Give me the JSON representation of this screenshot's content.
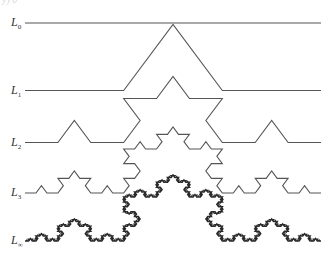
{
  "figure": {
    "title_fragment": "y) 0",
    "stroke_color": "#555555",
    "limit_stroke_color": "#2a2a2a",
    "x_start": 25,
    "x_end": 321,
    "peak_height": 66,
    "curves": [
      {
        "id": "L0",
        "label": "L",
        "subscript": "0",
        "iterations": 0,
        "baseline_y": 23,
        "stroke_width": 1.1
      },
      {
        "id": "L1",
        "label": "L",
        "subscript": "1",
        "iterations": 1,
        "baseline_y": 90.5,
        "stroke_width": 1.1
      },
      {
        "id": "L2",
        "label": "L",
        "subscript": "2",
        "iterations": 2,
        "baseline_y": 142.5,
        "stroke_width": 1.1
      },
      {
        "id": "L3",
        "label": "L",
        "subscript": "3",
        "iterations": 3,
        "baseline_y": 193,
        "stroke_width": 1.1
      },
      {
        "id": "Linf",
        "label": "L",
        "subscript": "∞",
        "iterations": 5,
        "baseline_y": 241,
        "stroke_width": 1.5
      }
    ]
  }
}
